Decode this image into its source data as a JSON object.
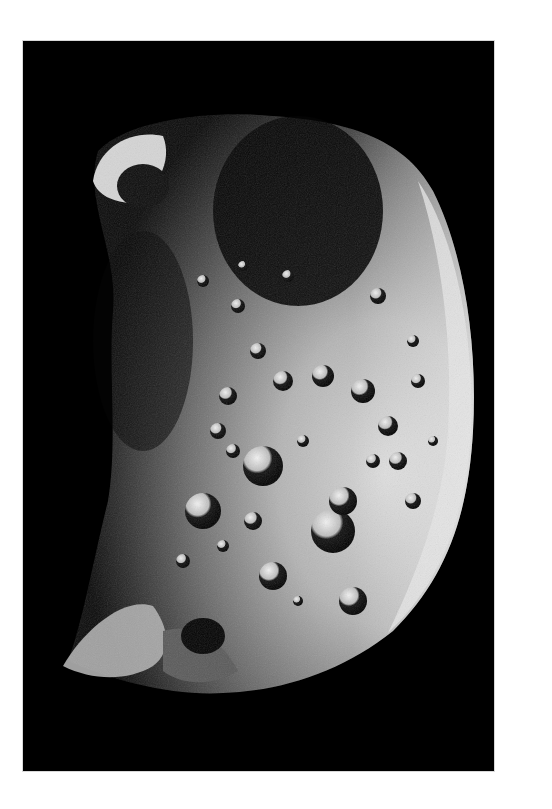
{
  "image": {
    "subject": "heavily cratered moon, crescent-lit",
    "background_color": "#ffffff",
    "frame_color": "#000000",
    "surface_highlight": "#e8e8e8",
    "surface_mid": "#8a8a8a",
    "surface_shadow": "#1a1a1a"
  }
}
